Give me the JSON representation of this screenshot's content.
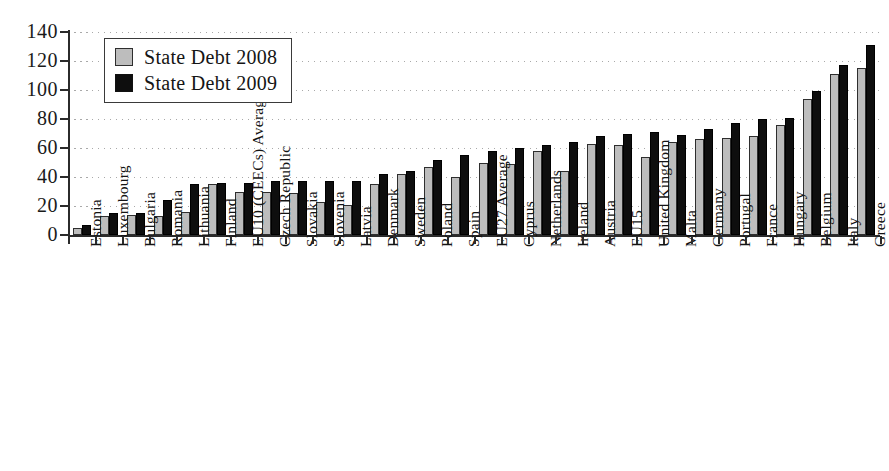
{
  "chart_data": {
    "type": "bar",
    "title": "",
    "subtitle": "",
    "xlabel": "",
    "ylabel": "",
    "ylim": [
      0,
      140
    ],
    "ytick_labels": [
      "140",
      "120",
      "100",
      "80",
      "60",
      "40",
      "20",
      "0"
    ],
    "ytick_values": [
      140,
      120,
      100,
      80,
      60,
      40,
      20,
      0
    ],
    "grid": "horizontal-dotted",
    "legend_position": "top-left-inside",
    "categories": [
      "Estonia",
      "Luxembourg",
      "Bulgaria",
      "Romania",
      "Lithuania",
      "Finland",
      "EU10 (CEECs) Average",
      "Czech Republic",
      "Slovakia",
      "Slovenia",
      "Latvia",
      "Denmark",
      "Sweden",
      "Poland",
      "Spain",
      "EU27 Average",
      "Cyprus",
      "Netherlands",
      "Ireland",
      "Austria",
      "EU15",
      "United Kingdom",
      "Malta",
      "Germany",
      "Portugal",
      "France",
      "Hungary",
      "Belgium",
      "Italy",
      "Greece"
    ],
    "series": [
      {
        "name": "State Debt 2008",
        "color": "#bdbdbd",
        "values": [
          5,
          13,
          14,
          13,
          16,
          35,
          30,
          30,
          29,
          23,
          21,
          35,
          42,
          47,
          40,
          50,
          49,
          58,
          44,
          63,
          62,
          54,
          64,
          66,
          67,
          68,
          76,
          94,
          111,
          115
        ]
      },
      {
        "name": "State Debt 2009",
        "color": "#0e0e0e",
        "values": [
          7,
          15,
          15,
          24,
          35,
          36,
          36,
          37,
          37,
          37,
          37,
          42,
          44,
          52,
          55,
          58,
          60,
          62,
          64,
          68,
          70,
          71,
          69,
          73,
          77,
          80,
          81,
          99,
          117,
          131
        ]
      }
    ]
  },
  "legend": {
    "entries": [
      {
        "label": "State Debt 2008",
        "swatch": "gray"
      },
      {
        "label": "State Debt 2009",
        "swatch": "black"
      }
    ]
  }
}
